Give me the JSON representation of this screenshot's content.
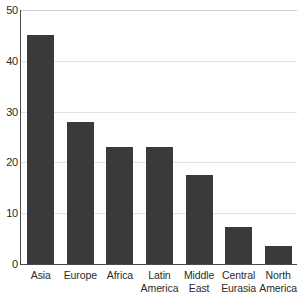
{
  "chart_data": {
    "type": "bar",
    "title": "",
    "subtitle": "",
    "xlabel": "",
    "ylabel": "",
    "categories": [
      "Asia",
      "Europe",
      "Africa",
      "Latin America",
      "Middle East",
      "Central Eurasia",
      "North America"
    ],
    "category_lines": [
      [
        "Asia"
      ],
      [
        "Europe"
      ],
      [
        "Africa"
      ],
      [
        "Latin",
        "America"
      ],
      [
        "Middle",
        "East"
      ],
      [
        "Central",
        "Eurasia"
      ],
      [
        "North",
        "America"
      ]
    ],
    "values": [
      45,
      28,
      23,
      23,
      17.5,
      7.3,
      3.5
    ],
    "ylim": [
      0,
      50
    ],
    "yticks": [
      0,
      10,
      20,
      30,
      40,
      50
    ],
    "ytick_labels": [
      "0",
      "10",
      "20",
      "30",
      "40",
      "50"
    ],
    "grid": true,
    "grid_axis": "y",
    "legend": false,
    "legend_position": "none",
    "bar_color": "#3a3a3a",
    "grid_color": "#e2e2e2",
    "axis_color": "#4a4a4a",
    "background_color": "#ffffff",
    "text_color": "#2b2b2b"
  }
}
